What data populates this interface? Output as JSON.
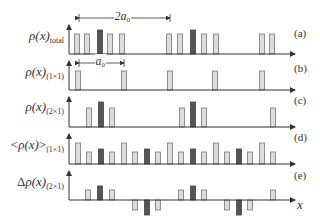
{
  "figure": {
    "colors": {
      "light_fill": "#dcdcdc",
      "light_stroke": "#777777",
      "dark_fill": "#555555",
      "dark_stroke": "#444444",
      "axis": "#333333"
    },
    "axis": {
      "x0": 69,
      "x1": 295
    },
    "bar_width": 5,
    "x_axis_label": "x",
    "dimensions": [
      {
        "name": "2a0",
        "main": "2a",
        "sub": "0",
        "x1": 79,
        "x2": 170,
        "y": 18
      },
      {
        "name": "a0",
        "main": "a",
        "sub": "0",
        "x1": 79,
        "x2": 124,
        "y": 63
      }
    ],
    "panels": [
      {
        "id": "a",
        "tag": "(a)",
        "label_main": "ρ(x)",
        "label_sub": "total",
        "label_prefix": "",
        "label_delta": "",
        "top": 25,
        "baseline": 54,
        "tag_y": 28,
        "label_y": 36,
        "bars": [
          {
            "x": 77,
            "h": 20,
            "dark": false
          },
          {
            "x": 87,
            "h": 20,
            "dark": false
          },
          {
            "x": 100,
            "h": 24,
            "dark": true
          },
          {
            "x": 110,
            "h": 20,
            "dark": false
          },
          {
            "x": 122,
            "h": 20,
            "dark": false
          },
          {
            "x": 169,
            "h": 20,
            "dark": false
          },
          {
            "x": 180,
            "h": 20,
            "dark": false
          },
          {
            "x": 193,
            "h": 24,
            "dark": true
          },
          {
            "x": 204,
            "h": 20,
            "dark": false
          },
          {
            "x": 216,
            "h": 20,
            "dark": false
          },
          {
            "x": 262,
            "h": 20,
            "dark": false
          },
          {
            "x": 272,
            "h": 20,
            "dark": false
          }
        ]
      },
      {
        "id": "b",
        "tag": "(b)",
        "label_main": "ρ(x)",
        "label_sub": "(1×1)",
        "label_prefix": "",
        "label_delta": "",
        "top": 61,
        "baseline": 90,
        "tag_y": 63,
        "label_y": 72,
        "bars": [
          {
            "x": 78,
            "h": 19,
            "dark": false
          },
          {
            "x": 124,
            "h": 19,
            "dark": false
          },
          {
            "x": 170,
            "h": 19,
            "dark": false
          },
          {
            "x": 215,
            "h": 19,
            "dark": false
          },
          {
            "x": 262,
            "h": 19,
            "dark": false
          }
        ]
      },
      {
        "id": "c",
        "tag": "(c)",
        "label_main": "ρ(x)",
        "label_sub": "(2×1)",
        "label_prefix": "",
        "label_delta": "",
        "top": 97,
        "baseline": 127,
        "tag_y": 95,
        "label_y": 107,
        "bars": [
          {
            "x": 89,
            "h": 19,
            "dark": false
          },
          {
            "x": 101,
            "h": 25,
            "dark": true
          },
          {
            "x": 112,
            "h": 19,
            "dark": false
          },
          {
            "x": 182,
            "h": 19,
            "dark": false
          },
          {
            "x": 193,
            "h": 25,
            "dark": true
          },
          {
            "x": 204,
            "h": 19,
            "dark": false
          },
          {
            "x": 273,
            "h": 19,
            "dark": false
          }
        ]
      },
      {
        "id": "d",
        "tag": "(d)",
        "label_main": "ρ(x)",
        "label_sub": "(1×1)",
        "label_prefix": "<",
        "label_suffix": ">",
        "label_delta": "",
        "top": 134,
        "baseline": 164,
        "tag_y": 132,
        "label_y": 145,
        "bars": [
          {
            "x": 78,
            "h": 21,
            "dark": false
          },
          {
            "x": 89,
            "h": 12,
            "dark": false
          },
          {
            "x": 101,
            "h": 15,
            "dark": true
          },
          {
            "x": 112,
            "h": 12,
            "dark": false
          },
          {
            "x": 124,
            "h": 21,
            "dark": false
          },
          {
            "x": 135,
            "h": 12,
            "dark": false
          },
          {
            "x": 147,
            "h": 15,
            "dark": true
          },
          {
            "x": 158,
            "h": 12,
            "dark": false
          },
          {
            "x": 170,
            "h": 21,
            "dark": false
          },
          {
            "x": 181,
            "h": 12,
            "dark": false
          },
          {
            "x": 193,
            "h": 15,
            "dark": true
          },
          {
            "x": 204,
            "h": 12,
            "dark": false
          },
          {
            "x": 216,
            "h": 21,
            "dark": false
          },
          {
            "x": 227,
            "h": 12,
            "dark": false
          },
          {
            "x": 239,
            "h": 15,
            "dark": true
          },
          {
            "x": 250,
            "h": 12,
            "dark": false
          },
          {
            "x": 262,
            "h": 21,
            "dark": false
          },
          {
            "x": 273,
            "h": 12,
            "dark": false
          }
        ]
      },
      {
        "id": "e",
        "tag": "(e)",
        "label_main": "ρ(x)",
        "label_sub": "(2×1)",
        "label_prefix": "",
        "label_delta": "Δ",
        "top": 171,
        "baseline": 200,
        "tag_y": 170,
        "label_y": 182,
        "bars": [
          {
            "x": 88,
            "h": 10,
            "dark": false
          },
          {
            "x": 100,
            "h": 14,
            "dark": true
          },
          {
            "x": 112,
            "h": 10,
            "dark": false
          },
          {
            "x": 135,
            "h": -10,
            "dark": false
          },
          {
            "x": 147,
            "h": -15,
            "dark": true
          },
          {
            "x": 158,
            "h": -10,
            "dark": false
          },
          {
            "x": 181,
            "h": 10,
            "dark": false
          },
          {
            "x": 193,
            "h": 14,
            "dark": true
          },
          {
            "x": 204,
            "h": 10,
            "dark": false
          },
          {
            "x": 227,
            "h": -10,
            "dark": false
          },
          {
            "x": 239,
            "h": -15,
            "dark": true
          },
          {
            "x": 250,
            "h": -10,
            "dark": false
          },
          {
            "x": 273,
            "h": 10,
            "dark": false
          }
        ]
      }
    ]
  }
}
